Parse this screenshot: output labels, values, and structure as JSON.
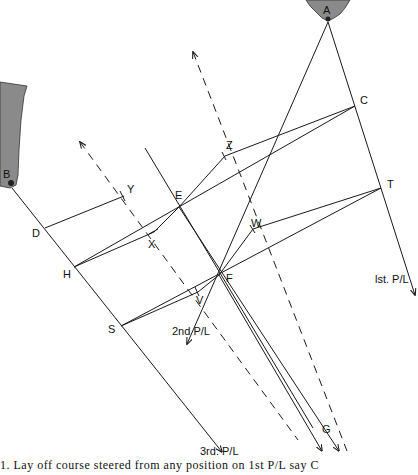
{
  "figure": {
    "caption": "1.   Lay off course steered from any position on 1st P/L say C",
    "points": {
      "A": {
        "label": "A",
        "x": 328,
        "y": 22,
        "lx": 323,
        "ly": 14
      },
      "B": {
        "label": "B",
        "x": 10,
        "y": 184,
        "lx": 3,
        "ly": 173
      },
      "C": {
        "label": "C",
        "x": 355,
        "y": 106,
        "lx": 360,
        "ly": 104
      },
      "T": {
        "label": "T",
        "x": 381,
        "y": 188,
        "lx": 387,
        "ly": 188
      },
      "Z": {
        "label": "Z",
        "x": 225,
        "y": 156,
        "lx": 226,
        "ly": 148
      },
      "E": {
        "label": "E",
        "x": 179,
        "y": 207,
        "lx": 175,
        "ly": 199
      },
      "Y": {
        "label": "Y",
        "x": 124,
        "y": 196,
        "lx": 127,
        "ly": 192
      },
      "D": {
        "label": "D",
        "x": 45,
        "y": 228,
        "lx": 32,
        "ly": 237
      },
      "X": {
        "label": "X",
        "x": 154,
        "y": 232,
        "lx": 148,
        "ly": 247
      },
      "H": {
        "label": "H",
        "x": 74,
        "y": 267,
        "lx": 63,
        "ly": 277
      },
      "W": {
        "label": "W",
        "x": 253,
        "y": 229,
        "lx": 251,
        "ly": 227
      },
      "F": {
        "label": "F",
        "x": 219,
        "y": 275,
        "lx": 226,
        "ly": 281
      },
      "V": {
        "label": "V",
        "x": 198,
        "y": 292,
        "lx": 196,
        "ly": 303
      },
      "S": {
        "label": "S",
        "x": 121,
        "y": 326,
        "lx": 108,
        "ly": 332
      },
      "G": {
        "label": "G",
        "x": 313,
        "y": 428,
        "lx": 322,
        "ly": 432
      }
    },
    "position_lines": [
      {
        "name": "1st P/L",
        "label": "lst. P/L",
        "lx": 375,
        "ly": 283
      },
      {
        "name": "2nd P/L",
        "label": "2nd P/L",
        "lx": 172,
        "ly": 335
      },
      {
        "name": "3rd P/L",
        "label": "3rd. P/L",
        "lx": 200,
        "ly": 459
      }
    ],
    "landmarks": [
      {
        "name": "headland-A",
        "marker": "A"
      },
      {
        "name": "headland-B",
        "marker": "B"
      }
    ],
    "colors": {
      "ink": "#1a1a1a",
      "background": "#ffffff",
      "cliff": "#7a7a7a"
    }
  }
}
